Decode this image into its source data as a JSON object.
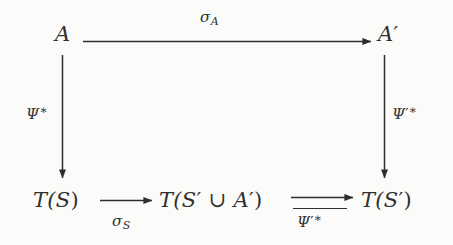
{
  "diagram": {
    "type": "commutative-diagram",
    "background_color": "#fbfbfa",
    "ink_color": "#2e2e2e",
    "nodes": [
      {
        "id": "A",
        "label": "A",
        "position": "top-left"
      },
      {
        "id": "Aprime",
        "label": "A′",
        "position": "top-right"
      },
      {
        "id": "TS",
        "label": "T(S)",
        "position": "bottom-left"
      },
      {
        "id": "TSuA",
        "label": "T(S′ ∪ A′)",
        "position": "bottom-middle"
      },
      {
        "id": "TSprime",
        "label": "T(S′)",
        "position": "bottom-right"
      }
    ],
    "node_parts": {
      "A": {
        "base": "A"
      },
      "Aprime": {
        "base": "A",
        "prime": "′"
      },
      "TS": {
        "open": "T(S",
        "close": ")"
      },
      "TSuA": {
        "t_open": "T(S",
        "prime1": "′",
        "union": " ∪ ",
        "a": "A",
        "prime2": "′",
        "close": ")"
      },
      "TSprime": {
        "open": "T(S",
        "prime": "′",
        "close": ")"
      }
    },
    "arrows": [
      {
        "id": "arrow-top",
        "from": "A",
        "to": "Aprime",
        "direction": "right",
        "label": "σ_A",
        "label_position": "above",
        "label_parts": {
          "symbol": "σ",
          "subscript": "A"
        }
      },
      {
        "id": "arrow-left-vertical",
        "from": "A",
        "to": "TS",
        "direction": "down",
        "label": "Ψ*",
        "label_position": "left",
        "label_parts": {
          "symbol": "Ψ",
          "superscript": "∗"
        }
      },
      {
        "id": "arrow-right-vertical",
        "from": "Aprime",
        "to": "TSprime",
        "direction": "down",
        "label": "Ψ′*",
        "label_position": "right",
        "label_parts": {
          "symbol": "Ψ",
          "prime": "′",
          "superscript": "∗"
        }
      },
      {
        "id": "arrow-bottom-left",
        "from": "TS",
        "to": "TSuA",
        "direction": "right",
        "label": "σ_S",
        "label_position": "below",
        "label_parts": {
          "symbol": "σ",
          "subscript": "S"
        }
      },
      {
        "id": "arrow-bottom-right",
        "from": "TSuA",
        "to": "TSprime",
        "direction": "right",
        "label": "Ψ′*",
        "label_position": "below-with-rule",
        "label_parts": {
          "symbol": "Ψ",
          "prime": "′",
          "superscript": "∗"
        }
      }
    ]
  }
}
